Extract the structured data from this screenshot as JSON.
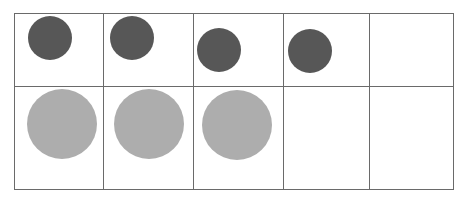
{
  "grid": {
    "rows": 2,
    "columns": 5,
    "row1": [
      {
        "filled": true,
        "shade": "dark",
        "color": "#575757"
      },
      {
        "filled": true,
        "shade": "dark",
        "color": "#575757"
      },
      {
        "filled": true,
        "shade": "dark",
        "color": "#575757"
      },
      {
        "filled": true,
        "shade": "dark",
        "color": "#575757"
      },
      {
        "filled": false
      }
    ],
    "row2": [
      {
        "filled": true,
        "shade": "light",
        "color": "#adadad"
      },
      {
        "filled": true,
        "shade": "light",
        "color": "#adadad"
      },
      {
        "filled": true,
        "shade": "light",
        "color": "#adadad"
      },
      {
        "filled": false
      },
      {
        "filled": false
      }
    ],
    "counts": {
      "small_dark_circles": 4,
      "large_light_circles": 3
    }
  }
}
